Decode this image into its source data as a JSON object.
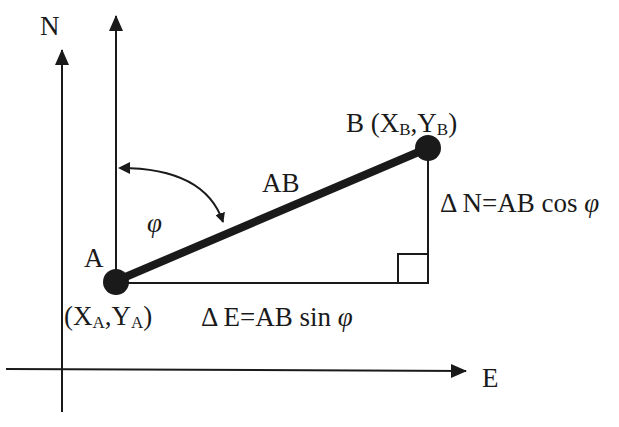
{
  "diagram": {
    "axes": {
      "north_label": "N",
      "east_label": "E"
    },
    "points": {
      "A": {
        "label": "A",
        "coord_open": "(X",
        "coord_x_sub": "A",
        "coord_sep": ",Y",
        "coord_y_sub": "A",
        "coord_close": ")"
      },
      "B": {
        "label": "B (X",
        "coord_x_sub": "B",
        "coord_sep": ",Y",
        "coord_y_sub": "B",
        "coord_close": ")"
      }
    },
    "segment_label": "AB",
    "angle_label": "φ",
    "delta_n": {
      "prefix": "Δ N=AB cos ",
      "symbol": "φ"
    },
    "delta_e": {
      "prefix": "Δ E=AB sin ",
      "symbol": "φ"
    },
    "colors": {
      "stroke": "#1a1a1a",
      "background": "#ffffff"
    }
  }
}
